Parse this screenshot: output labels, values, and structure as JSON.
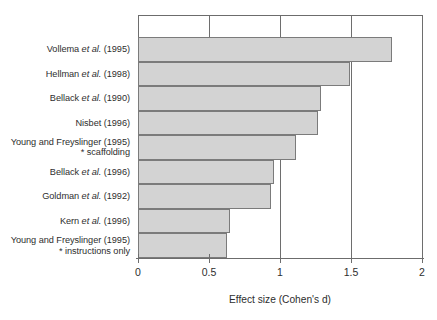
{
  "chart_data": {
    "type": "bar",
    "orientation": "horizontal",
    "title": "",
    "xlabel": "Effect size (Cohen's d)",
    "ylabel": "",
    "xlim": [
      0,
      2
    ],
    "xticks": [
      "0",
      "0.5",
      "1",
      "1.5",
      "2"
    ],
    "xtick_values": [
      0,
      0.5,
      1,
      1.5,
      2
    ],
    "grid": true,
    "legend": "none",
    "bar_fill_color": "#d3d3d3",
    "bar_border_color": "#7b7b7b",
    "axis_color": "#6c6c6c",
    "text_color": "#2e2e2e",
    "background_color": "#ffffff",
    "categories": [
      "Vollema et al. (1995)",
      "Hellman et al. (1998)",
      "Bellack et al. (1990)",
      "Nisbet (1996)",
      "Young and Freyslinger (1995) * scaffolding",
      "Bellack et al. (1996)",
      "Goldman et al. (1992)",
      "Kern et al. (1996)",
      "Young and Freyslinger (1995) * instructions only"
    ],
    "values": [
      1.79,
      1.49,
      1.29,
      1.27,
      1.11,
      0.96,
      0.94,
      0.65,
      0.63
    ]
  },
  "labels": [
    {
      "pre": "Vollema ",
      "italic": "et al.",
      "post": " (1995)",
      "sub": ""
    },
    {
      "pre": "Hellman ",
      "italic": "et al.",
      "post": " (1998)",
      "sub": ""
    },
    {
      "pre": "Bellack ",
      "italic": "et al.",
      "post": " (1990)",
      "sub": ""
    },
    {
      "pre": "Nisbet (1996)",
      "italic": "",
      "post": "",
      "sub": ""
    },
    {
      "pre": "Young and Freyslinger (1995)",
      "italic": "",
      "post": "",
      "sub": "* scaffolding"
    },
    {
      "pre": "Bellack ",
      "italic": "et al.",
      "post": " (1996)",
      "sub": ""
    },
    {
      "pre": "Goldman ",
      "italic": "et al.",
      "post": " (1992)",
      "sub": ""
    },
    {
      "pre": "Kern ",
      "italic": "et al.",
      "post": " (1996)",
      "sub": ""
    },
    {
      "pre": "Young and Freyslinger (1995)",
      "italic": "",
      "post": "",
      "sub": "* instructions only"
    }
  ]
}
